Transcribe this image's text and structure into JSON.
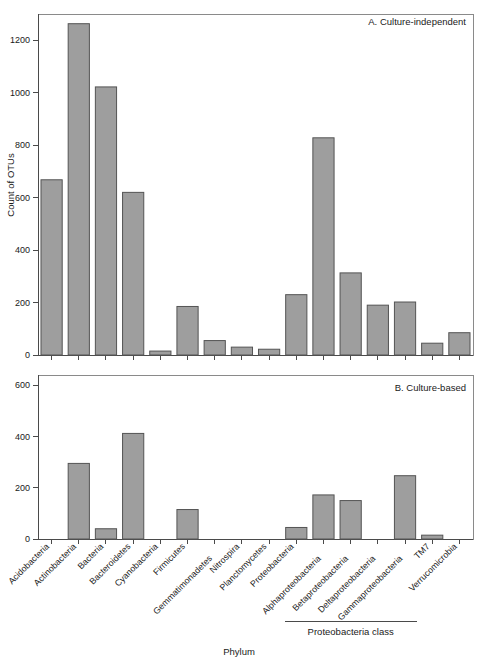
{
  "figure": {
    "xlabel": "Phylum",
    "ylabel": "Count of OTUs",
    "group_bracket_label": "Proteobacteria class",
    "categories": [
      "Acidobacteria",
      "Actinobacteria",
      "Bacteria",
      "Bacteroidetes",
      "Cyanobacteria",
      "Firmicutes",
      "Gemmatimonadetes",
      "Nitrospira",
      "Planctomycetes",
      "Proteobacteria",
      "Alphaproteobacteria",
      "Betaproteobacteria",
      "Deltaproteobacteria",
      "Gammaproteobacteria",
      "TM7",
      "Verrucomicrobia"
    ]
  },
  "chart_data": [
    {
      "type": "bar",
      "title": "A. Culture-independent",
      "xlabel": "Phylum",
      "ylabel": "Count of OTUs",
      "ylim": [
        0,
        1300
      ],
      "yticks": [
        0,
        200,
        400,
        600,
        800,
        1000,
        1200
      ],
      "ytick_labels": [
        "0",
        "200",
        "400",
        "600",
        "800",
        "1000",
        "1200"
      ],
      "grid": false,
      "legend": "none",
      "categories": [
        "Acidobacteria",
        "Actinobacteria",
        "Bacteria",
        "Bacteroidetes",
        "Cyanobacteria",
        "Firmicutes",
        "Gemmatimonadetes",
        "Nitrospira",
        "Planctomycetes",
        "Proteobacteria",
        "Alphaproteobacteria",
        "Betaproteobacteria",
        "Deltaproteobacteria",
        "Gammaproteobacteria",
        "TM7",
        "Verrucomicrobia"
      ],
      "values": [
        668,
        1263,
        1022,
        620,
        15,
        185,
        55,
        30,
        22,
        230,
        828,
        313,
        190,
        202,
        45,
        85
      ],
      "bar_fill": "#9e9e9e",
      "bar_edge": "#545454"
    },
    {
      "type": "bar",
      "title": "B. Culture-based",
      "xlabel": "Phylum",
      "ylabel": "Count of OTUs",
      "ylim": [
        0,
        640
      ],
      "yticks": [
        0,
        200,
        400,
        600
      ],
      "ytick_labels": [
        "0",
        "200",
        "400",
        "600"
      ],
      "grid": false,
      "legend": "none",
      "categories": [
        "Acidobacteria",
        "Actinobacteria",
        "Bacteria",
        "Bacteroidetes",
        "Cyanobacteria",
        "Firmicutes",
        "Gemmatimonadetes",
        "Nitrospira",
        "Planctomycetes",
        "Proteobacteria",
        "Alphaproteobacteria",
        "Betaproteobacteria",
        "Deltaproteobacteria",
        "Gammaproteobacteria",
        "TM7",
        "Verrucomicrobia"
      ],
      "values": [
        0,
        295,
        40,
        412,
        0,
        115,
        0,
        0,
        0,
        45,
        172,
        150,
        0,
        247,
        15,
        0
      ],
      "bar_fill": "#9e9e9e",
      "bar_edge": "#545454"
    }
  ],
  "colors": {
    "bar_fill": "#9e9e9e",
    "bar_edge": "#545454",
    "axis": "#4a4a4a",
    "frame": "#8a8a8a",
    "text": "#1a1a1a",
    "background": "#ffffff"
  }
}
